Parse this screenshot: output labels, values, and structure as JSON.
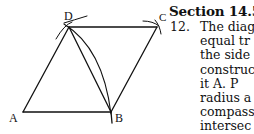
{
  "figure": {
    "labels": {
      "A": "A",
      "B": "B",
      "C": "C",
      "D": "D"
    },
    "points": {
      "A": [
        23,
        112
      ],
      "B": [
        111,
        112
      ],
      "C": [
        157,
        27
      ],
      "D": [
        69,
        27
      ]
    }
  },
  "section": {
    "heading": "Section 14.5",
    "problem_number": "12.",
    "lines": [
      "The diag",
      "equal tr",
      "the side",
      "construc",
      "it A.  P",
      "radius a",
      "compass",
      "intersec"
    ]
  }
}
